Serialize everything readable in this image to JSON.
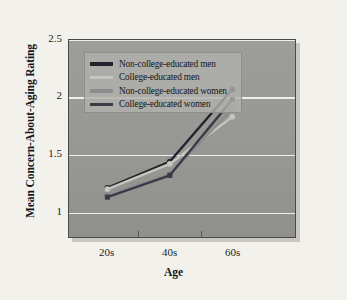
{
  "chart_data": {
    "type": "line",
    "title": "",
    "subtitle": "",
    "xlabel": "Age",
    "ylabel": "Mean Concern-About-Aging Rating",
    "categories": [
      "20s",
      "40s",
      "60s"
    ],
    "x_tick_labels": [
      "20s",
      "40s",
      "60s"
    ],
    "y_tick_labels": [
      "1",
      "1.5",
      "2",
      "2.5"
    ],
    "y_tick_values": [
      1,
      1.5,
      2,
      2.5
    ],
    "ylim": [
      0.78,
      2.5
    ],
    "xlim": [
      0,
      2
    ],
    "grid": "horizontal",
    "legend_position": "top-left",
    "markers": "filled",
    "series": [
      {
        "name": "Non-college-educated men",
        "color": "#23232e",
        "marker": "circle",
        "values": [
          1.21,
          1.44,
          2.07
        ]
      },
      {
        "name": "College-educated men",
        "color": "#c6c5c0",
        "marker": "circle",
        "values": [
          1.2,
          1.42,
          1.83
        ]
      },
      {
        "name": "Non-college-educated women",
        "color": "#8d8d8f",
        "marker": "circle",
        "values": [
          1.15,
          1.33,
          1.9
        ]
      },
      {
        "name": "College-educated women",
        "color": "#3b3b48",
        "marker": "square",
        "values": [
          1.13,
          1.32,
          1.98
        ]
      }
    ]
  },
  "figure": {
    "background_color": "#f2f1ec",
    "plot_background_color": "#979794",
    "gridline_color": "#efeeea",
    "frame_color": "#4a4a4c",
    "legend_background_color": "#b0b0ac"
  },
  "axes": {
    "y_title": "Mean Concern-About-Aging Rating",
    "x_title": "Age",
    "y_ticks": [
      {
        "label": "2.5",
        "value": 2.5
      },
      {
        "label": "2",
        "value": 2.0
      },
      {
        "label": "1.5",
        "value": 1.5
      },
      {
        "label": "1",
        "value": 1.0
      }
    ],
    "x_ticks": [
      {
        "label": "20s",
        "value": 0
      },
      {
        "label": "40s",
        "value": 1
      },
      {
        "label": "60s",
        "value": 2
      }
    ]
  },
  "legend": {
    "entries": [
      {
        "label": "Non-college-educated men",
        "color": "#23232e"
      },
      {
        "label": "College-educated men",
        "color": "#c6c5c0"
      },
      {
        "label": "Non-college-educated women",
        "color": "#8d8d8f"
      },
      {
        "label": "College-educated women",
        "color": "#3b3b48"
      }
    ]
  }
}
